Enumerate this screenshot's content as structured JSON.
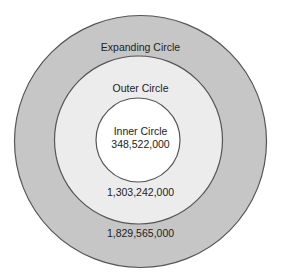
{
  "diagram": {
    "type": "concentric-circles",
    "colors": {
      "expanding_fill": "#c6c6c6",
      "outer_fill": "#ececec",
      "inner_fill": "#ffffff",
      "stroke": "#555555",
      "text": "#222222"
    },
    "circles": [
      {
        "name": "Expanding Circle",
        "label": "Expanding Circle",
        "value": "1,829,565,000"
      },
      {
        "name": "Outer Circle",
        "label": "Outer Circle",
        "value": "1,303,242,000"
      },
      {
        "name": "Inner Circle",
        "label": "Inner Circle",
        "value": "348,522,000"
      }
    ]
  }
}
